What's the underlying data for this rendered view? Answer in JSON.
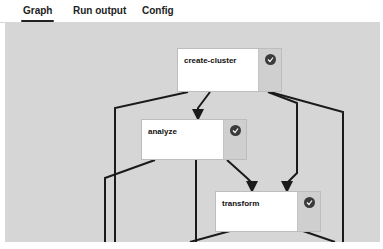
{
  "tabs": [
    {
      "label": "Graph",
      "active": true
    },
    {
      "label": "Run output",
      "active": false
    },
    {
      "label": "Config",
      "active": false
    }
  ],
  "graph": {
    "nodes": [
      {
        "id": "create-cluster",
        "label": "create-cluster",
        "status": "success"
      },
      {
        "id": "analyze",
        "label": "analyze",
        "status": "success"
      },
      {
        "id": "transform",
        "label": "transform",
        "status": "success"
      }
    ],
    "edge_color": "#1a1a1a",
    "canvas_color": "#d6d6d6"
  }
}
